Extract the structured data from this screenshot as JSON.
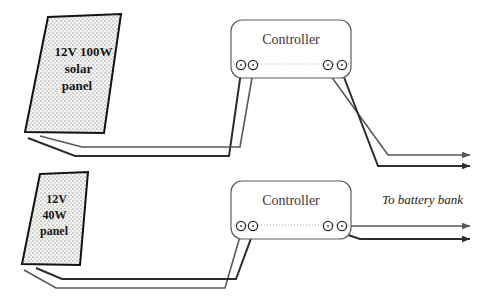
{
  "diagram": {
    "type": "wiring-schematic",
    "canvas": {
      "width": 489,
      "height": 307,
      "background": "#ffffff"
    },
    "colors": {
      "wire": "#2c2c31",
      "wire_light": "#57575d",
      "panel_outline": "#121214",
      "panel_fill": "#f4f4f2",
      "panel_dots": "#9a9a9a",
      "controller_outline": "#5c5c63",
      "controller_text": "#3a3a3f",
      "label_text": "#17171a"
    },
    "panels": [
      {
        "id": "panel-top",
        "name": "12V 100W solar panel",
        "lines": [
          "12V 100W",
          "solar",
          "panel"
        ],
        "shape": "parallelogram",
        "points": "48,17 121,14 104,133 25,132",
        "text_x": 72,
        "text_y": 56,
        "line_height": 17,
        "font_size": 13
      },
      {
        "id": "panel-bottom",
        "name": "12V 40W panel",
        "lines": [
          "12V",
          "40W",
          "panel"
        ],
        "shape": "parallelogram",
        "points": "40,174 88,172 80,265 22,264",
        "text_x": 55,
        "text_y": 203,
        "line_height": 16,
        "font_size": 12
      }
    ],
    "controllers": [
      {
        "id": "controller-top",
        "label": "Controller",
        "x": 231,
        "y": 20,
        "width": 120,
        "height": 58,
        "radius": 11,
        "label_x": 291,
        "label_y": 44,
        "font_size": 14,
        "divider_y": 64,
        "terminals_left": [
          241,
          253
        ],
        "terminals_right": [
          328,
          342
        ],
        "terminal_y": 65,
        "terminal_r": 4.6
      },
      {
        "id": "controller-bottom",
        "label": "Controller",
        "x": 231,
        "y": 181,
        "width": 120,
        "height": 58,
        "radius": 11,
        "label_x": 291,
        "label_y": 205,
        "font_size": 14,
        "divider_y": 225,
        "terminals_left": [
          241,
          253
        ],
        "terminals_right": [
          328,
          342
        ],
        "terminal_y": 226,
        "terminal_r": 4.6
      }
    ],
    "annotations": [
      {
        "id": "to-battery-bank",
        "text": "To battery bank",
        "x": 382,
        "y": 204,
        "font_size": 13,
        "style": "italic"
      }
    ],
    "wires": [
      {
        "id": "wire-top-panel-positive",
        "from": "panel-top",
        "to": "controller-top-terminal-1",
        "path": "M 28,138 L 75,156 L 229,156 L 241,72",
        "width": 2.0,
        "color": "#2c2c31"
      },
      {
        "id": "wire-top-panel-negative",
        "from": "panel-top",
        "to": "controller-top-terminal-2",
        "path": "M 40,136 L 82,147 L 240,147 L 253,72",
        "width": 1.6,
        "color": "#57575d"
      },
      {
        "id": "wire-top-out-positive",
        "from": "controller-top-terminal-3",
        "to": "battery-bank",
        "path": "M 328,72 L 388,155 L 470,155",
        "width": 1.6,
        "color": "#57575d",
        "arrow": true
      },
      {
        "id": "wire-top-out-negative",
        "from": "controller-top-terminal-4",
        "to": "battery-bank",
        "path": "M 342,72 L 378,166 L 470,166",
        "width": 2.0,
        "color": "#2c2c31",
        "arrow": true
      },
      {
        "id": "wire-bottom-panel-positive",
        "from": "panel-bottom",
        "to": "controller-bottom-terminal-1",
        "path": "M 24,270 L 56,288 L 225,288 L 241,233",
        "width": 1.6,
        "color": "#57575d"
      },
      {
        "id": "wire-bottom-panel-negative",
        "from": "panel-bottom",
        "to": "controller-bottom-terminal-2",
        "path": "M 36,268 L 62,279 L 236,279 L 253,233",
        "width": 2.0,
        "color": "#2c2c31"
      },
      {
        "id": "wire-bottom-out-positive",
        "from": "controller-bottom-terminal-3",
        "to": "battery-bank",
        "path": "M 328,233 L 352,226 L 470,226",
        "width": 1.6,
        "color": "#57575d",
        "arrow": true
      },
      {
        "id": "wire-bottom-out-negative",
        "from": "controller-bottom-terminal-4",
        "to": "battery-bank",
        "path": "M 342,233 L 360,239 L 470,239",
        "width": 2.0,
        "color": "#2c2c31",
        "arrow": true
      }
    ]
  }
}
